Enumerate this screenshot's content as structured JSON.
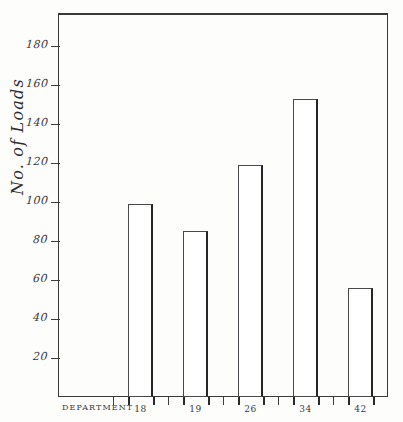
{
  "chart_data": {
    "type": "bar",
    "title": "",
    "xlabel": "DEPARTMENT",
    "ylabel": "No. of Loads",
    "categories": [
      "18",
      "19",
      "26",
      "34",
      "42"
    ],
    "values": [
      99,
      85,
      119,
      153,
      56
    ],
    "ylim": [
      0,
      197
    ],
    "yticks": [
      20,
      40,
      60,
      80,
      100,
      120,
      140,
      160,
      180
    ],
    "ytick_labels": [
      "20",
      "40",
      "60",
      "80",
      "100",
      "120",
      "140",
      "160",
      "180"
    ],
    "grid": false,
    "legend": null,
    "series": [
      {
        "name": "No. of Loads",
        "values": [
          99,
          85,
          119,
          153,
          56
        ]
      }
    ],
    "style": {
      "bar_fill": "#ffffff",
      "bar_edge": "#4a4a4c",
      "axis_color": "#3a3a3a",
      "text_color": "#39383a",
      "background": "#fdfdfc"
    }
  },
  "axes": {
    "y_title": "No. of Loads",
    "x_title": "DEPARTMENT"
  }
}
